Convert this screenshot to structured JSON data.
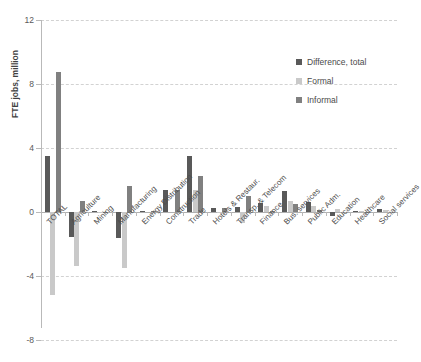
{
  "chart_data": {
    "type": "bar",
    "title": "",
    "xlabel": "",
    "ylabel": "FTE jobs, million",
    "ylim": [
      -8,
      12
    ],
    "yticks": [
      12,
      8,
      4,
      0,
      -4,
      -8
    ],
    "ytick_labels": [
      "12",
      "8",
      "4",
      "0",
      "-4",
      "-8"
    ],
    "grid": true,
    "legend_position": "top-right",
    "categories": [
      "TOTAL",
      "Agriculture",
      "Mining",
      "Manufacturing",
      "Energy Distribution",
      "Construction",
      "Trade",
      "Hotels & Restaur.",
      "Transp. & Telecom",
      "Finance",
      "Bus. services",
      "Public Adm.",
      "Education",
      "Healthcare",
      "Social services"
    ],
    "series": [
      {
        "name": "Difference, total",
        "color": "#595959",
        "values": [
          3.5,
          -1.55,
          0.05,
          -1.6,
          0.05,
          1.35,
          3.5,
          0.28,
          0.3,
          0.55,
          1.3,
          0.62,
          -0.22,
          0.07,
          0.18
        ]
      },
      {
        "name": "Formal",
        "color": "#c9c9c9",
        "values": [
          -5.2,
          -3.4,
          0.02,
          -3.5,
          0.0,
          0.0,
          1.35,
          0.02,
          -0.7,
          0.4,
          0.7,
          0.4,
          0.18,
          0.04,
          0.15
        ]
      },
      {
        "name": "Informal",
        "color": "#808080",
        "values": [
          8.75,
          0.7,
          0.03,
          1.6,
          0.05,
          1.4,
          2.25,
          0.22,
          1.0,
          0.05,
          0.48,
          0.1,
          0.0,
          0.02,
          0.0
        ]
      }
    ]
  },
  "legend": {
    "items": [
      {
        "label": "Difference, total",
        "color": "#595959"
      },
      {
        "label": "Formal",
        "color": "#c9c9c9"
      },
      {
        "label": "Informal",
        "color": "#808080"
      }
    ]
  }
}
